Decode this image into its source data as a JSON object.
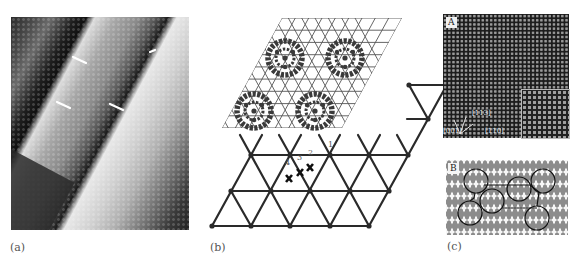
{
  "figure": {
    "panels": [
      {
        "id": "a",
        "label": "(a)",
        "description": "STM image of stepped surface with C60 molecules; white arrows mark step-edge features"
      },
      {
        "id": "b",
        "label": "(b)",
        "description": "Schematic of C60 hexagonal overlayer on triangular substrate lattice with adsorption sites"
      },
      {
        "id": "c",
        "label": "(c)",
        "description": "Atomic-resolution image (A) and structural model (B)"
      }
    ],
    "panel_b": {
      "site_labels": [
        "1",
        "2",
        "3",
        "4"
      ]
    },
    "panel_c": {
      "inset_A_label": "A",
      "inset_B_label": "B",
      "directions": [
        "[113]",
        "[001]",
        "[110]"
      ]
    }
  },
  "colors": {
    "lattice_line": "#2a2a2a",
    "fine_lattice": "#555555",
    "molecule": "#3a3a3a",
    "panel_label": "#555555",
    "stm_dark": "#1a1a1a",
    "stm_light": "#f2f2f2"
  }
}
